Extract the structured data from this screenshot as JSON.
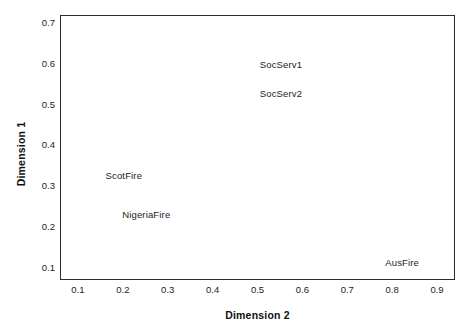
{
  "chart_data": {
    "type": "scatter",
    "title": "",
    "subtitle": "",
    "xlabel": "Dimension 2",
    "ylabel": "Dimension 1",
    "xlim": [
      0.06,
      0.94
    ],
    "ylim": [
      0.07,
      0.72
    ],
    "xticks": [
      "0.1",
      "0.2",
      "0.3",
      "0.4",
      "0.5",
      "0.6",
      "0.7",
      "0.8",
      "0.9"
    ],
    "yticks": [
      "0.1",
      "0.2",
      "0.3",
      "0.4",
      "0.5",
      "0.6",
      "0.7"
    ],
    "xtick_values": [
      0.1,
      0.2,
      0.3,
      0.4,
      0.5,
      0.6,
      0.7,
      0.8,
      0.9
    ],
    "ytick_values": [
      0.1,
      0.2,
      0.3,
      0.4,
      0.5,
      0.6,
      0.7
    ],
    "grid": false,
    "legend": "none",
    "markers": "none",
    "labels_only": true,
    "points": [
      {
        "label": "SocServ1",
        "x": 0.55,
        "y": 0.6
      },
      {
        "label": "SocServ2",
        "x": 0.55,
        "y": 0.528
      },
      {
        "label": "ScotFire",
        "x": 0.2,
        "y": 0.328
      },
      {
        "label": "NigeriaFire",
        "x": 0.25,
        "y": 0.233
      },
      {
        "label": "AusFire",
        "x": 0.82,
        "y": 0.113
      }
    ]
  },
  "colors": {
    "frame": "#2b2b2b",
    "text": "#1c1c1c",
    "title_text": "#111111",
    "background": "#ffffff"
  }
}
